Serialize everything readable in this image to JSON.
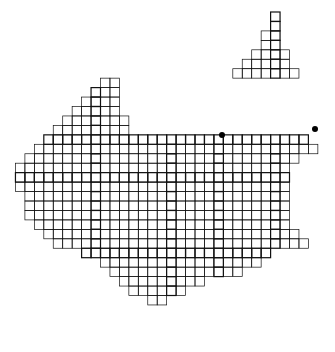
{
  "map": {
    "title": "Grid map of region",
    "cell": 9.45,
    "origin": [
      16,
      12
    ],
    "colors": {
      "grid": "#111111",
      "border": "#333333",
      "dot": "#000000",
      "bg": "#ffffff"
    },
    "rows": [
      [
        28,
        29
      ],
      [
        28,
        29
      ],
      [
        27,
        29
      ],
      [
        27,
        29
      ],
      [
        26,
        30
      ],
      [
        25,
        30
      ],
      [
        24,
        31
      ],
      [
        10,
        12
      ],
      [
        9,
        12
      ],
      [
        8,
        12
      ],
      [
        7,
        12
      ],
      [
        6,
        13
      ],
      [
        5,
        13
      ],
      [
        4,
        32
      ],
      [
        3,
        33
      ],
      [
        2,
        31
      ],
      [
        1,
        30
      ],
      [
        1,
        30
      ],
      [
        1,
        30
      ],
      [
        2,
        30
      ],
      [
        2,
        30
      ],
      [
        2,
        30
      ],
      [
        3,
        30
      ],
      [
        4,
        31
      ],
      [
        5,
        32
      ],
      [
        8,
        28
      ],
      [
        10,
        27
      ],
      [
        11,
        25
      ],
      [
        12,
        21
      ],
      [
        13,
        19
      ],
      [
        15,
        17
      ]
    ],
    "row_start": 0,
    "thick_cols": [
      9,
      17,
      22,
      28
    ],
    "thick_rows": [
      13,
      17,
      25
    ],
    "dots": [
      [
        222,
        135
      ],
      [
        315,
        129
      ]
    ]
  }
}
